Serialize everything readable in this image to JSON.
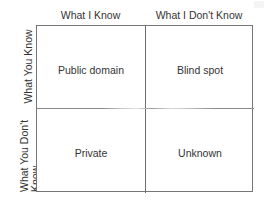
{
  "diagram": {
    "type": "johari-window",
    "columns": [
      {
        "id": "known-to-self",
        "header": "What I Know"
      },
      {
        "id": "unknown-to-self",
        "header": "What I Don't Know"
      }
    ],
    "rows": [
      {
        "id": "known-to-others",
        "label": "What You Know",
        "label_lines": [
          "What You Know"
        ]
      },
      {
        "id": "unknown-to-others",
        "label": "What You Don't Know",
        "label_lines": [
          "What You Don't",
          "Know"
        ]
      }
    ],
    "quadrants": [
      {
        "id": "public-domain",
        "label": "Public domain",
        "row": 0,
        "column": 0
      },
      {
        "id": "blind-spot",
        "label": "Blind spot",
        "row": 0,
        "column": 1
      },
      {
        "id": "private",
        "label": "Private",
        "row": 1,
        "column": 0
      },
      {
        "id": "unknown",
        "label": "Unknown",
        "row": 1,
        "column": 1
      }
    ],
    "colors": {
      "background": "#ffffff",
      "border": "#757575",
      "divider": "#6e6e6e",
      "text": "#343434"
    }
  }
}
